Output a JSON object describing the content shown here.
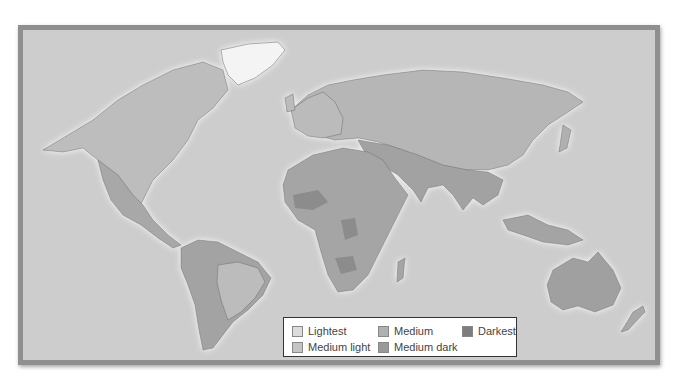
{
  "map": {
    "type": "choropleth-world-map",
    "ocean_color": "#cdcdcd",
    "frame_color": "#8f8f8f"
  },
  "legend": {
    "items": [
      {
        "label": "Lightest",
        "color": "#dcdcdc"
      },
      {
        "label": "Medium light",
        "color": "#c4c4c4"
      },
      {
        "label": "Medium",
        "color": "#b0b0b0"
      },
      {
        "label": "Medium dark",
        "color": "#999999"
      },
      {
        "label": "Darkest",
        "color": "#7d7d7d"
      }
    ]
  },
  "regions": {
    "greenland": {
      "color": "#f4f4f4"
    },
    "north_america_north": {
      "color": "#bdbdbd"
    },
    "north_america_south": {
      "color": "#a8a8a8"
    },
    "south_america_west": {
      "color": "#a3a3a3"
    },
    "south_america_east": {
      "color": "#bcbcbc"
    },
    "europe": {
      "color": "#bbbbbb"
    },
    "russia": {
      "color": "#b6b6b6"
    },
    "asia_south": {
      "color": "#a2a2a2"
    },
    "africa": {
      "color": "#a5a5a5"
    },
    "africa_dark": {
      "color": "#8c8c8c"
    },
    "australia": {
      "color": "#a0a0a0"
    }
  }
}
